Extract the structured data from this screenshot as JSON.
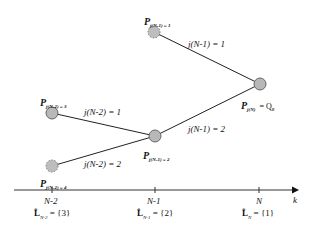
{
  "diagram": {
    "nodes": [
      {
        "id": "top",
        "label_main": "P",
        "label_sub": "j(N-1) = 1",
        "style": "dashed",
        "x": 154,
        "y": 32
      },
      {
        "id": "right",
        "label_main": "P",
        "label_sub": "j(N)",
        "label_suffix": "= Q",
        "label_suffix_sub": "0",
        "style": "solid",
        "x": 260,
        "y": 84
      },
      {
        "id": "left-upper",
        "label_main": "P",
        "label_sub": "j(N-2) = 3",
        "style": "solid",
        "x": 52,
        "y": 113
      },
      {
        "id": "middle",
        "label_main": "P",
        "label_sub": "j(N-1) = 2",
        "style": "solid",
        "x": 155,
        "y": 136
      },
      {
        "id": "left-lower",
        "label_main": "P",
        "label_sub": "j(N-2) = 4",
        "style": "dashed",
        "x": 52,
        "y": 166
      }
    ],
    "edges": [
      {
        "from": "top",
        "to": "right",
        "label": "j(N-1) = 1"
      },
      {
        "from": "middle",
        "to": "right",
        "label": "j(N-1) = 2"
      },
      {
        "from": "left-upper",
        "to": "middle",
        "label": "j(N-2) = 1"
      },
      {
        "from": "left-lower",
        "to": "middle",
        "label": "j(N-2) = 2"
      }
    ],
    "axis": {
      "label": "k",
      "ticks": [
        {
          "label": "N-2",
          "set_symbol": "L̂",
          "set_sub": "N-2",
          "set_value": "= {3}"
        },
        {
          "label": "N-1",
          "set_symbol": "L̂",
          "set_sub": "N-1",
          "set_value": "= {2}"
        },
        {
          "label": "N",
          "set_symbol": "L̂",
          "set_sub": "N",
          "set_value": "= {1}"
        }
      ]
    },
    "colors": {
      "node_fill": "#b8b8b8",
      "node_stroke": "#6e6e6e",
      "line": "#222222"
    }
  }
}
